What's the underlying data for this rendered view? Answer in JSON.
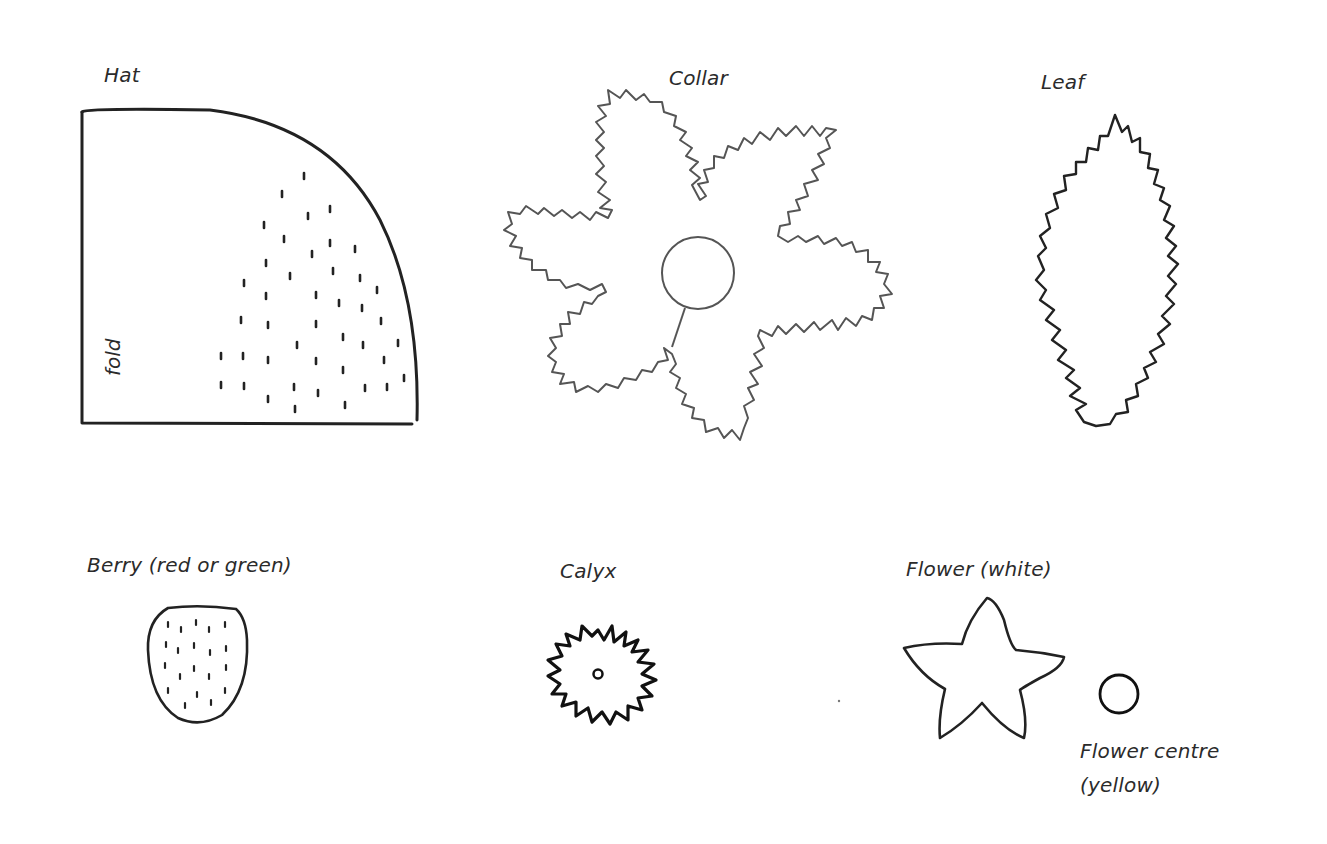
{
  "pieces": {
    "hat": {
      "label": "Hat",
      "fold_label": "fold"
    },
    "collar": {
      "label": "Collar"
    },
    "leaf": {
      "label": "Leaf"
    },
    "berry": {
      "label": "Berry (red or green)"
    },
    "calyx": {
      "label": "Calyx"
    },
    "flower": {
      "label": "Flower (white)"
    },
    "flower_centre": {
      "label_line1": "Flower centre",
      "label_line2": "(yellow)"
    }
  },
  "colors": {
    "ink": "#2b2b2b",
    "pencil": "#555555",
    "background": "#ffffff"
  }
}
